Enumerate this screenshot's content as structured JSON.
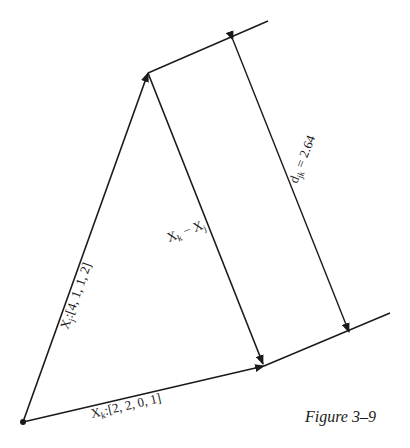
{
  "figure": {
    "caption": "Figure 3–9",
    "stroke_color": "#1a1a1a"
  },
  "vectors": {
    "xj": {
      "label_main": "X",
      "label_sub": "j",
      "label_rest": ":[4, 1, 1, 2]"
    },
    "xk": {
      "label_main": "X",
      "label_sub": "k",
      "label_rest": ":[2, 2, 0, 1]"
    },
    "diff": {
      "label_a": "X",
      "label_a_sub": "k",
      "label_op": " − ",
      "label_b": "X",
      "label_b_sub": "j"
    },
    "distance": {
      "label_main": "d",
      "label_sub": "jk",
      "label_rest": " = 2.64"
    }
  }
}
